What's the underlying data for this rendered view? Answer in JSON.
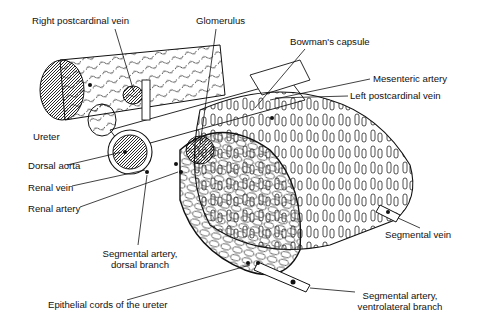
{
  "figure": {
    "type": "anatomical-illustration",
    "background": "#ffffff",
    "ink_color": "#111111"
  },
  "labels": [
    {
      "id": "right-postcardinal-vein",
      "text": "Right postcardinal vein",
      "x": 32,
      "y": 20
    },
    {
      "id": "glomerulus",
      "text": "Glomerulus",
      "x": 196,
      "y": 20
    },
    {
      "id": "bowmans-capsule",
      "text": "Bowman's capsule",
      "x": 290,
      "y": 39
    },
    {
      "id": "mesenteric-artery",
      "text": "Mesenteric artery",
      "x": 373,
      "y": 75
    },
    {
      "id": "left-postcardinal-vein",
      "text": "Left postcardinal vein",
      "x": 350,
      "y": 92
    },
    {
      "id": "ureter",
      "text": "Ureter",
      "x": 33,
      "y": 134
    },
    {
      "id": "dorsal-aorta",
      "text": "Dorsal aorta",
      "x": 28,
      "y": 163
    },
    {
      "id": "renal-vein",
      "text": "Renal vein",
      "x": 28,
      "y": 184
    },
    {
      "id": "renal-artery",
      "text": "Renal artery",
      "x": 28,
      "y": 205
    },
    {
      "id": "segmental-artery-dorsal",
      "text_lines": [
        "Segmental artery,",
        "dorsal branch"
      ],
      "x": 95,
      "y": 249
    },
    {
      "id": "segmental-vein",
      "text": "Segmental vein",
      "x": 385,
      "y": 230
    },
    {
      "id": "epithelial-cords",
      "text": "Epithelial cords of the ureter",
      "x": 48,
      "y": 301
    },
    {
      "id": "segmental-artery-ventrolateral",
      "text_lines": [
        "Segmental artery,",
        "ventrolateral branch"
      ],
      "x": 352,
      "y": 292
    }
  ],
  "text": {
    "right_postcardinal_vein": "Right postcardinal vein",
    "glomerulus": "Glomerulus",
    "bowmans_capsule": "Bowman's capsule",
    "mesenteric_artery": "Mesenteric artery",
    "left_postcardinal_vein": "Left postcardinal vein",
    "ureter": "Ureter",
    "dorsal_aorta": "Dorsal aorta",
    "renal_vein": "Renal vein",
    "renal_artery": "Renal artery",
    "segmental_artery_dorsal_1": "Segmental artery,",
    "segmental_artery_dorsal_2": "dorsal branch",
    "segmental_vein": "Segmental vein",
    "epithelial_cords": "Epithelial cords of the ureter",
    "segmental_artery_ventro_1": "Segmental artery,",
    "segmental_artery_ventro_2": "ventrolateral branch"
  }
}
